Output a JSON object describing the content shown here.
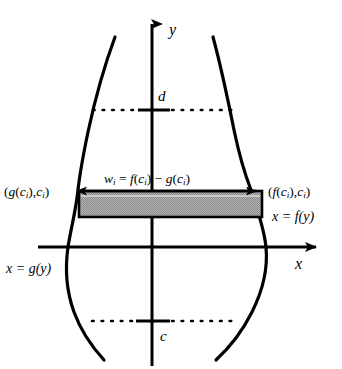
{
  "figure": {
    "type": "math-diagram",
    "background_color": "#ffffff",
    "stroke_color": "#000000",
    "rect_fill_color": "#a8a8a8"
  },
  "axes": {
    "y_label": "y",
    "x_label": "x",
    "origin": {
      "x": 152,
      "y": 247
    }
  },
  "ticks": {
    "upper": {
      "label": "d",
      "y": 110
    },
    "lower": {
      "label": "c",
      "y": 321
    }
  },
  "curves": {
    "left_label": "x = g(y)",
    "right_label": "x = f(y)"
  },
  "points": {
    "left": "(g(c i ),c i )",
    "right": "(f(c i ),c i )"
  },
  "width_annotation": {
    "text": "w i = f(c i ) − g(c i )",
    "parts": {
      "w": "w",
      "i1": "i",
      "eq": " = ",
      "f": "f",
      "open1": "(",
      "c1": "c",
      "i2": "i",
      "close1": ")",
      "minus": " − ",
      "g": "g",
      "open2": "(",
      "c2": "c",
      "i3": "i",
      "close2": ")"
    }
  },
  "point_parts": {
    "left": {
      "open": "(",
      "g": "g",
      "open2": "(",
      "c": "c",
      "i1": "i",
      "close2": "),",
      "c2": "c",
      "i2": "i",
      "close": ")"
    },
    "right": {
      "open": "(",
      "f": "f",
      "open2": "(",
      "c": "c",
      "i1": "i",
      "close2": "),",
      "c2": "c",
      "i2": "i",
      "close": ")"
    }
  }
}
